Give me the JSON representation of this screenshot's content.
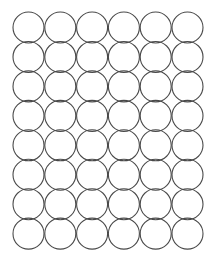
{
  "sheet": {
    "background": "#ffffff",
    "stroke_color": "#4a4a4a",
    "stroke_width": 1.1,
    "rows": 8,
    "columns": 6,
    "circle_radius": 15.5,
    "first_center_x": 28.5,
    "first_center_y": 27.5,
    "column_pitch": 31.8,
    "row_pitch": 29.45
  }
}
